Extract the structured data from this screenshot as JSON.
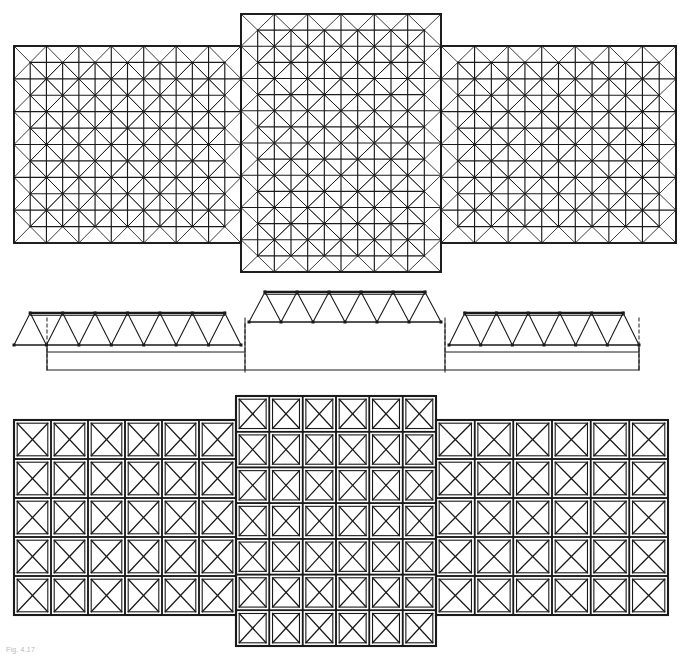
{
  "drawing": {
    "title": "Space frame roof structure — top chord plan, longitudinal section, bottom chord plan",
    "caption": "Fig. 4.17",
    "line_color": "#1a1a1a",
    "background_color": "#ffffff",
    "sheet_width": 687,
    "sheet_height": 659,
    "projection": "orthographic multi-view"
  },
  "views": [
    {
      "id": "top-chord-plan",
      "name": "Top chord plan",
      "label": "top-chord-plan",
      "bounds": {
        "x": 14,
        "y": 14,
        "w": 662,
        "h": 260
      },
      "module": 31,
      "description": "Double-layer grid shown as square modules with full X diagonal bracing, overlaid by a half-module offset secondary grid, producing the dense pin-wheel appearance.",
      "segments": [
        {
          "id": "left-wing",
          "bounds": {
            "x": 14,
            "y": 46,
            "w": 227,
            "h": 197
          },
          "cols": 7,
          "rows": 6
        },
        {
          "id": "center-bay",
          "bounds": {
            "x": 241,
            "y": 14,
            "w": 200,
            "h": 258
          },
          "cols": 6,
          "rows": 8
        },
        {
          "id": "right-wing",
          "bounds": {
            "x": 441,
            "y": 46,
            "w": 235,
            "h": 197
          },
          "cols": 7,
          "rows": 6
        }
      ]
    },
    {
      "id": "longitudinal-section",
      "name": "Longitudinal section",
      "label": "longitudinal-section",
      "bounds": {
        "x": 14,
        "y": 288,
        "w": 625,
        "h": 88
      },
      "description": "Warren truss elevation. Low side trusses flank a raised central truss; dashed vertical lines mark the column/support lines, with the supporting substructure outline below.",
      "trusses": [
        {
          "id": "left-truss",
          "x0": 14,
          "x1": 241,
          "top_y": 313,
          "bottom_y": 345,
          "panels": 7,
          "type": "warren"
        },
        {
          "id": "center-truss",
          "x0": 249,
          "x1": 441,
          "top_y": 292,
          "bottom_y": 322,
          "panels": 6,
          "type": "warren"
        },
        {
          "id": "right-truss",
          "x0": 449,
          "x1": 639,
          "top_y": 313,
          "bottom_y": 345,
          "panels": 6,
          "type": "warren"
        }
      ],
      "support_lines": [
        {
          "id": "support-line-left",
          "x": 47,
          "style": "dashed"
        },
        {
          "id": "support-line-center-left",
          "x": 245,
          "style": "dashed"
        },
        {
          "id": "support-line-center-right",
          "x": 445,
          "style": "dashed"
        },
        {
          "id": "support-line-right",
          "x": 639,
          "style": "dashed"
        }
      ],
      "substructure_outline": {
        "x0": 47,
        "x1": 639,
        "y": 370
      }
    },
    {
      "id": "bottom-chord-plan",
      "name": "Bottom chord plan",
      "label": "bottom-chord-plan",
      "bounds": {
        "x": 14,
        "y": 396,
        "w": 654,
        "h": 250
      },
      "module": 36,
      "description": "Single-layer square module grid, every module braced with a full X (two diagonals corner to corner).",
      "segments": [
        {
          "id": "left-wing",
          "bounds": {
            "x": 14,
            "y": 420,
            "w": 222,
            "h": 195
          },
          "cols": 6,
          "rows": 5
        },
        {
          "id": "center-bay",
          "bounds": {
            "x": 236,
            "y": 396,
            "w": 200,
            "h": 250
          },
          "cols": 6,
          "rows": 7
        },
        {
          "id": "right-wing",
          "bounds": {
            "x": 436,
            "y": 420,
            "w": 232,
            "h": 195
          },
          "cols": 6,
          "rows": 5
        }
      ]
    }
  ]
}
